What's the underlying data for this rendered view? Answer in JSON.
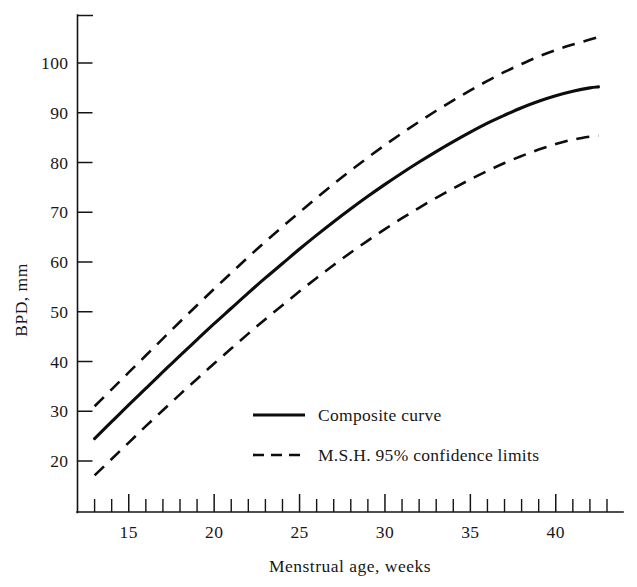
{
  "chart_data": {
    "type": "line",
    "title": "",
    "xlabel": "Menstrual age, weeks",
    "ylabel": "BPD, mm",
    "xlim": [
      12.5,
      43.0
    ],
    "ylim": [
      14.0,
      109.0
    ],
    "grid": false,
    "legend_position": "center-right-inside",
    "x_ticks_labeled": [
      15,
      20,
      25,
      30,
      35,
      40
    ],
    "x_ticks_minor_step": 1,
    "x_tick_min": 13,
    "x_tick_max": 43,
    "y_ticks_labeled": [
      20,
      30,
      40,
      50,
      60,
      70,
      80,
      90,
      100
    ],
    "x": [
      13,
      14,
      15,
      16,
      17,
      18,
      19,
      20,
      21,
      22,
      23,
      24,
      25,
      26,
      27,
      28,
      29,
      30,
      31,
      32,
      33,
      34,
      35,
      36,
      37,
      38,
      39,
      40,
      41,
      42,
      42.5
    ],
    "series": [
      {
        "name": "M.S.H. 95% confidence limits (upper)",
        "style": "dashed",
        "values": [
          31.0,
          34.4,
          37.8,
          41.2,
          44.6,
          48.0,
          51.3,
          54.6,
          57.8,
          61.0,
          64.1,
          67.1,
          70.0,
          72.9,
          75.7,
          78.4,
          81.0,
          83.5,
          85.9,
          88.2,
          90.4,
          92.5,
          94.5,
          96.4,
          98.2,
          99.8,
          101.3,
          102.6,
          103.7,
          104.7,
          105.2
        ]
      },
      {
        "name": "Composite curve",
        "style": "solid",
        "values": [
          24.5,
          27.9,
          31.3,
          34.6,
          37.9,
          41.2,
          44.4,
          47.6,
          50.7,
          53.8,
          56.8,
          59.7,
          62.6,
          65.4,
          68.1,
          70.7,
          73.2,
          75.6,
          77.9,
          80.1,
          82.2,
          84.2,
          86.1,
          87.9,
          89.5,
          91.0,
          92.3,
          93.4,
          94.3,
          95.0,
          95.2
        ]
      },
      {
        "name": "M.S.H. 95% confidence limits (lower)",
        "style": "dashed",
        "values": [
          17.1,
          20.4,
          23.7,
          27.0,
          30.2,
          33.4,
          36.5,
          39.6,
          42.6,
          45.6,
          48.5,
          51.3,
          54.1,
          56.8,
          59.4,
          61.9,
          64.3,
          66.6,
          68.8,
          70.9,
          72.9,
          74.8,
          76.6,
          78.3,
          79.9,
          81.3,
          82.6,
          83.7,
          84.6,
          85.2,
          85.4
        ]
      }
    ],
    "legend": [
      {
        "label": "Composite curve",
        "style": "solid"
      },
      {
        "label": "M.S.H. 95% confidence limits",
        "style": "dashed"
      }
    ]
  }
}
